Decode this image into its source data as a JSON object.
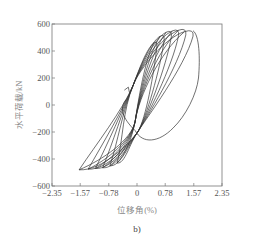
{
  "chart_data": {
    "type": "line",
    "subtype": "hysteresis-loops",
    "title": "",
    "caption": "b)",
    "xlabel": "位移角(%)",
    "ylabel": "水平荷载/kN",
    "xlim": [
      -2.35,
      2.35
    ],
    "ylim": [
      -600,
      600
    ],
    "xticks": [
      -2.35,
      -1.57,
      -0.78,
      0,
      0.78,
      1.57,
      2.35
    ],
    "xtick_labels": [
      "-2.35",
      "-1.57",
      "-0.78",
      "0",
      "0.78",
      "1.57",
      "2.35"
    ],
    "yticks": [
      600,
      400,
      200,
      0,
      -200,
      -400,
      -600
    ],
    "ytick_labels": [
      "600",
      "400",
      "200",
      "0",
      "-200",
      "-400",
      "-600"
    ],
    "grid": false,
    "legend": null,
    "series_color": "#333333",
    "series": [
      {
        "name": "loop-1",
        "peak_pos": [
          0.55,
          470
        ],
        "peak_neg": [
          -0.55,
          -430
        ]
      },
      {
        "name": "loop-2",
        "peak_pos": [
          0.75,
          520
        ],
        "peak_neg": [
          -0.75,
          -450
        ]
      },
      {
        "name": "loop-3",
        "peak_pos": [
          0.95,
          550
        ],
        "peak_neg": [
          -0.95,
          -465
        ]
      },
      {
        "name": "loop-4",
        "peak_pos": [
          1.15,
          560
        ],
        "peak_neg": [
          -1.15,
          -470
        ]
      },
      {
        "name": "loop-5",
        "peak_pos": [
          1.35,
          565
        ],
        "peak_neg": [
          -1.35,
          -475
        ]
      },
      {
        "name": "loop-6",
        "peak_pos": [
          1.55,
          555
        ],
        "peak_neg": [
          -1.6,
          -480
        ]
      },
      {
        "name": "final-degradation",
        "peak_pos": [
          1.65,
          540
        ],
        "end": [
          -0.1,
          -300
        ]
      }
    ]
  }
}
